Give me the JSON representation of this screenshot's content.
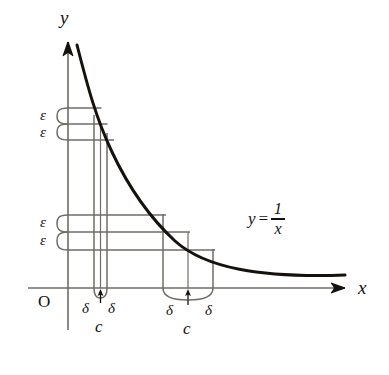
{
  "figure": {
    "title_equation": "y = 1/x",
    "equation": {
      "lhs": "y",
      "relation": "=",
      "numerator": "1",
      "denominator": "x"
    },
    "axes": {
      "x_label": "x",
      "y_label": "y",
      "origin_label": "O",
      "x_axis_y": 288,
      "y_axis_x": 68
    },
    "curve": {
      "function": "y = 1/x",
      "color": "#15120e",
      "stroke_width": 3.0,
      "start": {
        "x": 77,
        "y": 45
      },
      "end": {
        "x": 345,
        "y": 275
      }
    },
    "line_color": "#6f6c65",
    "bands": [
      {
        "name": "upper-epsilon-band",
        "epsilon_labels": [
          "ε",
          "ε"
        ],
        "y_top": 108,
        "y_mid": 124,
        "y_bottom": 140
      },
      {
        "name": "lower-epsilon-band",
        "epsilon_labels": [
          "ε",
          "ε"
        ],
        "y_top": 215,
        "y_mid": 232,
        "y_bottom": 250
      }
    ],
    "delta_groups": [
      {
        "name": "first-c-delta-group",
        "c_label": "c",
        "delta_labels": [
          "δ",
          "δ"
        ],
        "c_x": 100,
        "left_x": 94,
        "right_x": 107
      },
      {
        "name": "second-c-delta-group",
        "c_label": "c",
        "delta_labels": [
          "δ",
          "δ"
        ],
        "c_x": 188,
        "left_x": 163,
        "right_x": 213
      }
    ]
  }
}
